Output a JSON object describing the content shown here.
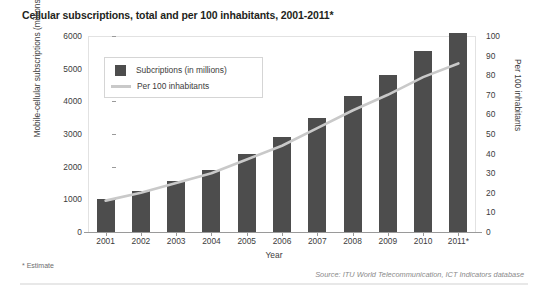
{
  "chart_data": {
    "type": "bar",
    "title": "Cellular subscriptions, total and per 100 inhabitants, 2001-2011*",
    "xlabel": "Year",
    "ylabel": "Mobile-cellular subscriptions (millions)",
    "y2label": "Per 100 inhabitants",
    "categories": [
      "2001",
      "2002",
      "2003",
      "2004",
      "2005",
      "2006",
      "2007",
      "2008",
      "2009",
      "2010",
      "2011*"
    ],
    "ylim": [
      0,
      6000
    ],
    "y2lim": [
      0,
      100
    ],
    "yticks": [
      "0",
      "1000",
      "2000",
      "3000",
      "4000",
      "5000",
      "6000"
    ],
    "y2ticks": [
      "0",
      "10",
      "20",
      "30",
      "40",
      "50",
      "60",
      "70",
      "80",
      "90",
      "100"
    ],
    "grid": false,
    "legend_position": "upper-left-inside",
    "series": [
      {
        "name": "Subcriptions (in millions)",
        "type": "bar",
        "axis": "left",
        "color": "#4d4d4d",
        "values": [
          1000,
          1250,
          1550,
          1900,
          2400,
          2900,
          3500,
          4150,
          4800,
          5550,
          6100
        ]
      },
      {
        "name": "Per 100 inhabitants",
        "type": "line",
        "axis": "right",
        "color": "#c9c9c9",
        "values": [
          16,
          20,
          25,
          30,
          37,
          44,
          53,
          62,
          70,
          79,
          86
        ]
      }
    ],
    "annotations": {
      "footnote": "* Estimate",
      "source": "Source: ITU World Telecommunication, ICT Indicators database"
    }
  },
  "legend": {
    "items": [
      {
        "label": "Subcriptions (in millions)",
        "marker": "square-swatch-icon"
      },
      {
        "label": "Per 100 inhabitants",
        "marker": "line-swatch-icon"
      }
    ]
  }
}
